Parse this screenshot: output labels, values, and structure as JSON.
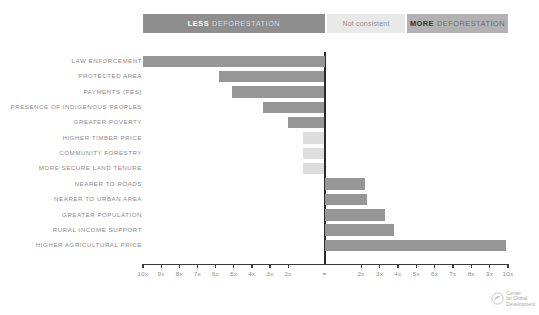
{
  "legend": {
    "less": {
      "strong": "LESS",
      "rest": "DEFORESTATION"
    },
    "middle": {
      "label": "Not consistent"
    },
    "more": {
      "strong": "MORE",
      "rest": "DEFORESTATION"
    }
  },
  "logo": {
    "line1": "Center",
    "line2": "for Global",
    "line3": "Development",
    "alt": "center-for-global-development-logo"
  },
  "caption": {
    "text": ""
  },
  "colors": {
    "bar_dark": "#969696",
    "bar_light": "#dddddd",
    "legend_less_bg": "#8e8e8e",
    "legend_middle_bg": "#e9e9e9",
    "legend_more_bg": "#b2b2b2",
    "axis": "#3c3c3c",
    "label_text": "#8d8d8d"
  },
  "chart_data": {
    "type": "bar",
    "orientation": "horizontal",
    "title": "",
    "subtitle": "",
    "xlabel": "",
    "ylabel": "",
    "xlim": [
      -10,
      10
    ],
    "grid": false,
    "legend_position": "top",
    "axis_note": "Axis is a ratio scale: '=' at centre (1x, no change); values to the left mean LESS deforestation, to the right MORE deforestation.",
    "xticks": [
      {
        "value": -10,
        "label": "10x"
      },
      {
        "value": -9,
        "label": "9x"
      },
      {
        "value": -8,
        "label": "8x"
      },
      {
        "value": -7,
        "label": "7x"
      },
      {
        "value": -6,
        "label": "6x"
      },
      {
        "value": -5,
        "label": "5x"
      },
      {
        "value": -4,
        "label": "4x"
      },
      {
        "value": -3,
        "label": "3x"
      },
      {
        "value": -2,
        "label": "2x"
      },
      {
        "value": 0,
        "label": "="
      },
      {
        "value": 2,
        "label": "2x"
      },
      {
        "value": 3,
        "label": "3x"
      },
      {
        "value": 4,
        "label": "4x"
      },
      {
        "value": 5,
        "label": "5x"
      },
      {
        "value": 6,
        "label": "6x"
      },
      {
        "value": 7,
        "label": "7x"
      },
      {
        "value": 8,
        "label": "8x"
      },
      {
        "value": 9,
        "label": "9x"
      },
      {
        "value": 10,
        "label": "10x"
      }
    ],
    "categories": [
      "LAW ENFORCEMENT",
      "PROTECTED AREA",
      "PAYMENTS (PES)",
      "PRESENCE OF INDIGENOUS PEOPLES",
      "GREATER POVERTY",
      "HIGHER TIMBER PRICE",
      "COMMUNITY FORESTRY",
      "MORE SECURE LAND TENURE",
      "NEARER TO ROADS",
      "NEARER TO URBAN AREA",
      "GREATER POPULATION",
      "RURAL INCOME SUPPORT",
      "HIGHER AGRICULTURAL PRICE"
    ],
    "values": [
      -10.0,
      -5.8,
      -5.1,
      -3.4,
      -2.0,
      -1.2,
      -1.2,
      -1.2,
      2.2,
      2.3,
      3.3,
      3.8,
      9.9
    ],
    "bar_styles": [
      "dark",
      "dark",
      "dark",
      "dark",
      "dark",
      "light",
      "light",
      "light",
      "dark",
      "dark",
      "dark",
      "dark",
      "dark"
    ],
    "bars": [
      {
        "category": "LAW ENFORCEMENT",
        "value": -10.0,
        "style": "dark",
        "side": "less"
      },
      {
        "category": "PROTECTED AREA",
        "value": -5.8,
        "style": "dark",
        "side": "less"
      },
      {
        "category": "PAYMENTS (PES)",
        "value": -5.1,
        "style": "dark",
        "side": "less"
      },
      {
        "category": "PRESENCE OF INDIGENOUS PEOPLES",
        "value": -3.4,
        "style": "dark",
        "side": "less"
      },
      {
        "category": "GREATER POVERTY",
        "value": -2.0,
        "style": "dark",
        "side": "less"
      },
      {
        "category": "HIGHER TIMBER PRICE",
        "value": -1.2,
        "style": "light",
        "side": "not-consistent"
      },
      {
        "category": "COMMUNITY FORESTRY",
        "value": -1.2,
        "style": "light",
        "side": "not-consistent"
      },
      {
        "category": "MORE SECURE LAND TENURE",
        "value": -1.2,
        "style": "light",
        "side": "not-consistent"
      },
      {
        "category": "NEARER TO ROADS",
        "value": 2.2,
        "style": "dark",
        "side": "more"
      },
      {
        "category": "NEARER TO URBAN AREA",
        "value": 2.3,
        "style": "dark",
        "side": "more"
      },
      {
        "category": "GREATER POPULATION",
        "value": 3.3,
        "style": "dark",
        "side": "more"
      },
      {
        "category": "RURAL INCOME SUPPORT",
        "value": 3.8,
        "style": "dark",
        "side": "more"
      },
      {
        "category": "HIGHER AGRICULTURAL PRICE",
        "value": 9.9,
        "style": "dark",
        "side": "more"
      }
    ]
  }
}
